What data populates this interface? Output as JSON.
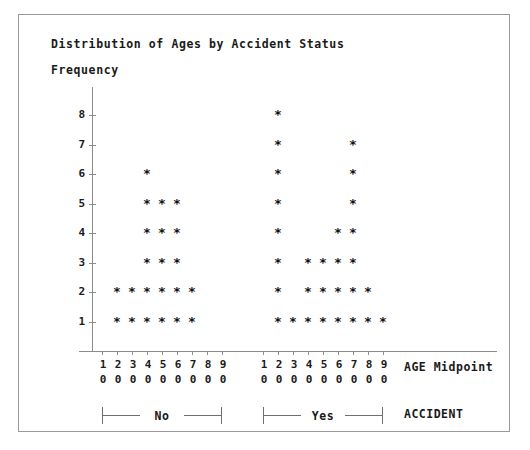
{
  "title": "Distribution of Ages by Accident Status",
  "y_axis_label": "Frequency",
  "x_axis_title": "AGE Midpoint",
  "group_axis_title": "ACCIDENT",
  "symbol": "*",
  "groups": [
    {
      "key": "no",
      "label": "No"
    },
    {
      "key": "yes",
      "label": "Yes"
    }
  ],
  "chart_data": {
    "type": "scatter",
    "plot_style": "dot-plot (stacked asterisk frequency plot)",
    "title": "Distribution of Ages by Accident Status",
    "xlabel": "AGE Midpoint",
    "ylabel": "Frequency",
    "grid": false,
    "legend": "none",
    "ylim": [
      0,
      8
    ],
    "yticks": [
      1,
      2,
      3,
      4,
      5,
      6,
      7,
      8
    ],
    "ytick_labels": [
      "1",
      "2",
      "3",
      "4",
      "5",
      "6",
      "7",
      "8"
    ],
    "xticks": [
      10,
      20,
      30,
      40,
      50,
      60,
      70,
      80,
      90
    ],
    "xtick_labels_top": [
      "1",
      "2",
      "3",
      "4",
      "5",
      "6",
      "7",
      "8",
      "9"
    ],
    "xtick_labels_bottom": [
      "0",
      "0",
      "0",
      "0",
      "0",
      "0",
      "0",
      "0",
      "0"
    ],
    "panel_label": "ACCIDENT",
    "series": [
      {
        "name": "No",
        "categories": [
          10,
          20,
          30,
          40,
          50,
          60,
          70,
          80,
          90
        ],
        "values": [
          0,
          2,
          2,
          6,
          5,
          5,
          2,
          0,
          0
        ]
      },
      {
        "name": "Yes",
        "categories": [
          10,
          20,
          30,
          40,
          50,
          60,
          70,
          80,
          90
        ],
        "values": [
          0,
          8,
          1,
          3,
          3,
          4,
          7,
          2,
          1
        ]
      }
    ]
  }
}
